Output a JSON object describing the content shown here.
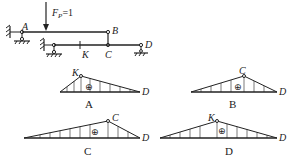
{
  "structure": {
    "load_label": "F",
    "load_subscript": "P",
    "load_value": "=1",
    "points": {
      "A": "A",
      "B": "B",
      "C": "C",
      "D": "D",
      "K": "K"
    }
  },
  "options": [
    {
      "caption": "A",
      "peak_label": "K",
      "end_label": "D",
      "sign": "⊕"
    },
    {
      "caption": "B",
      "peak_label": "C",
      "end_label": "D",
      "sign": "⊕"
    },
    {
      "caption": "C",
      "peak_label": "C",
      "end_label": "D",
      "sign": "⊕"
    },
    {
      "caption": "D",
      "peak_label": "K",
      "end_label": "D",
      "sign": "⊕"
    }
  ],
  "colors": {
    "line": "#222222",
    "background": "#ffffff"
  }
}
